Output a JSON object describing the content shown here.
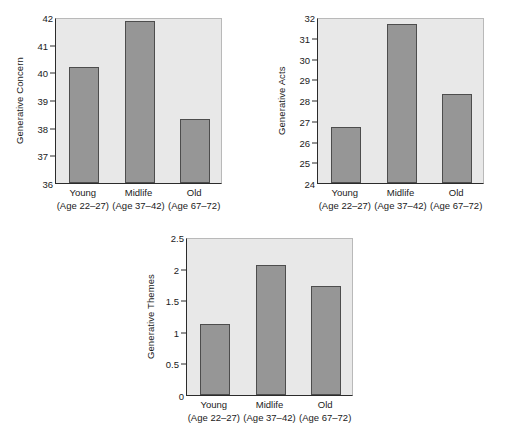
{
  "chart_data": [
    {
      "type": "bar",
      "title": "",
      "xlabel": "",
      "ylabel": "Generative Concern",
      "categories": [
        "Young",
        "Midlife",
        "Old"
      ],
      "category_sublabels": [
        "(Age 22–27)",
        "(Age 37–42)",
        "(Age 67–72)"
      ],
      "values": [
        40.2,
        41.85,
        38.3
      ],
      "ylim": [
        36,
        42
      ],
      "yticks": [
        36,
        37,
        38,
        39,
        40,
        41,
        42
      ],
      "ytick_labels": [
        "36",
        "37",
        "38",
        "39",
        "40",
        "41",
        "42"
      ],
      "grid": false,
      "legend": "none",
      "bar_color": "#969696",
      "bar_edge_color": "#4d4d4d",
      "plot_background": "#e8e8e8"
    },
    {
      "type": "bar",
      "title": "",
      "xlabel": "",
      "ylabel": "Generative Acts",
      "categories": [
        "Young",
        "Midlife",
        "Old"
      ],
      "category_sublabels": [
        "(Age 22–27)",
        "(Age 37–42)",
        "(Age 67–72)"
      ],
      "values": [
        26.7,
        31.65,
        28.3
      ],
      "ylim": [
        24,
        32
      ],
      "yticks": [
        24,
        25,
        26,
        27,
        28,
        29,
        30,
        31,
        32
      ],
      "ytick_labels": [
        "24",
        "25",
        "26",
        "27",
        "28",
        "29",
        "30",
        "31",
        "32"
      ],
      "grid": false,
      "legend": "none",
      "bar_color": "#969696",
      "bar_edge_color": "#4d4d4d",
      "plot_background": "#e8e8e8"
    },
    {
      "type": "bar",
      "title": "",
      "xlabel": "",
      "ylabel": "Generative Themes",
      "categories": [
        "Young",
        "Midlife",
        "Old"
      ],
      "category_sublabels": [
        "(Age 22–27)",
        "(Age 37–42)",
        "(Age 67–72)"
      ],
      "values": [
        1.12,
        2.05,
        1.72
      ],
      "ylim": [
        0,
        2.5
      ],
      "yticks": [
        0,
        0.5,
        1,
        1.5,
        2,
        2.5
      ],
      "ytick_labels": [
        "0",
        "0.5",
        "1",
        "1.5",
        "2",
        "2.5"
      ],
      "grid": false,
      "legend": "none",
      "bar_color": "#969696",
      "bar_edge_color": "#4d4d4d",
      "plot_background": "#e8e8e8"
    }
  ]
}
